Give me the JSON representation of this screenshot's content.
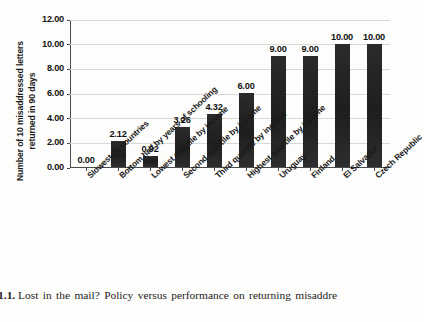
{
  "figure": {
    "y_axis_title_line1": "Number of 10 misaddressed letters",
    "y_axis_title_line2": "returned in 90 days",
    "caption_figure_number": "ure 1.1.",
    "caption_text": "Lost in the mail? Policy versus performance on returning misaddre",
    "caption_line2": "elopes"
  },
  "colors": {
    "bar": "#262626",
    "gridline": "#d8d8d8",
    "axis": "#4a4a4a",
    "background": "#fdfdfb"
  },
  "chart_data": {
    "type": "bar",
    "title": "",
    "xlabel": "",
    "ylabel": "Number of 10 misaddressed letters returned in 90 days",
    "ylim": [
      0,
      12
    ],
    "ytick_labels": [
      "12.00",
      "10.00",
      "8.00",
      "6.00",
      "4.00",
      "2.00",
      "0.00"
    ],
    "ytick_values": [
      12,
      10,
      8,
      6,
      4,
      2,
      0
    ],
    "grid": true,
    "legend": false,
    "categories": [
      "Slowest 25 countries",
      "Bottom half by years of schooling",
      "Lowest quartile by income",
      "Second quartile by income",
      "Third quartile by income",
      "Highest quartile by income",
      "Uruguay",
      "Finland",
      "El Salvador",
      "Czech Republic"
    ],
    "values": [
      0.0,
      2.12,
      0.92,
      3.26,
      4.32,
      6.0,
      9.0,
      9.0,
      10.0,
      10.0
    ],
    "data_labels": [
      "0.00",
      "2.12",
      "0.92",
      "3.26",
      "4.32",
      "6.00",
      "9.00",
      "9.00",
      "10.00",
      "10.00"
    ]
  }
}
